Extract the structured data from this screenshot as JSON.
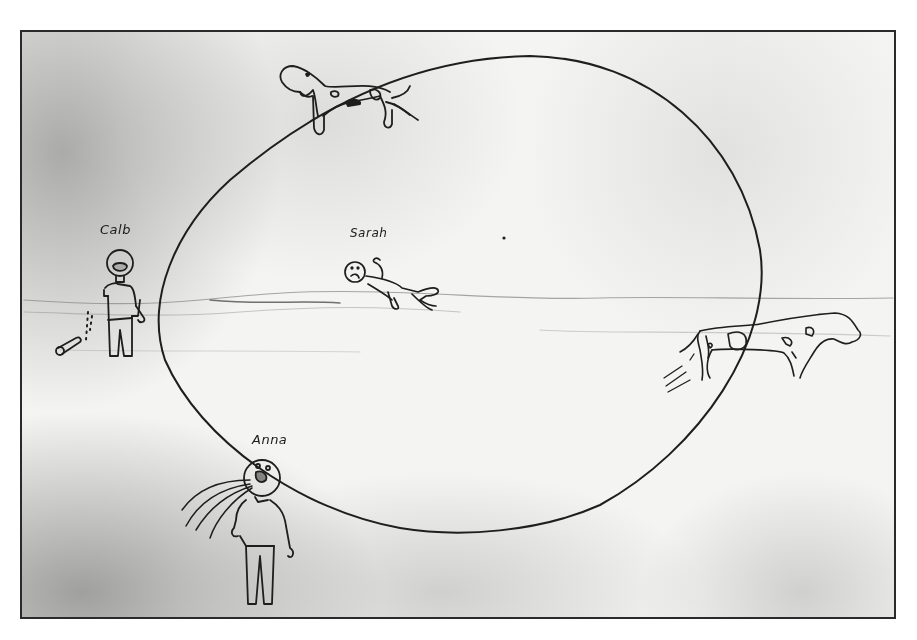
{
  "drawing": {
    "frame": {
      "x": 20,
      "y": 30,
      "width": 876,
      "height": 589,
      "border_color": "#2a2a2a"
    },
    "ink_color": "#1e1e1e",
    "paper_color": "#f4f4f2",
    "orbit": {
      "shape": "egg-ellipse",
      "top": [
        530,
        55
      ],
      "left": [
        157,
        300
      ],
      "bottom": [
        450,
        533
      ],
      "right": [
        761,
        265
      ]
    },
    "figures": [
      {
        "name": "Calb",
        "label": "Calb",
        "description": "stick figure standing left of orbit with open mouth, dropped bottle/can with dotted trail",
        "label_pos": [
          100,
          222
        ]
      },
      {
        "name": "Sarah",
        "label": "Sarah",
        "description": "figure floating horizontally inside orbit, frowning face",
        "label_pos": [
          350,
          232
        ]
      },
      {
        "name": "Anna",
        "label": "Anna",
        "description": "figure at bottom of orbit blowing/breathing air streams",
        "label_pos": [
          253,
          437
        ]
      }
    ],
    "animals": [
      {
        "name": "top-cow",
        "description": "spotted cow on top of orbit near top-left",
        "position": [
          280,
          60
        ]
      },
      {
        "name": "right-cow",
        "description": "spotted cow running at right edge of orbit with motion lines",
        "position": [
          660,
          310
        ]
      }
    ],
    "marks": [
      {
        "name": "pencil-dot",
        "position": [
          504,
          237
        ]
      }
    ]
  }
}
